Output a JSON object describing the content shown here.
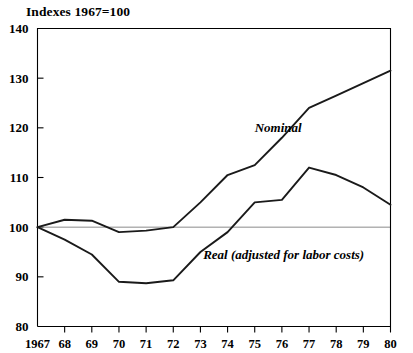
{
  "chart_data": {
    "type": "line",
    "title": "Indexes 1967=100",
    "xlabel": "",
    "ylabel": "",
    "ylim": [
      80,
      140
    ],
    "yticks": [
      80,
      90,
      100,
      110,
      120,
      130,
      140
    ],
    "ytick_labels": [
      "80",
      "90",
      "100",
      "110",
      "120",
      "130",
      "140"
    ],
    "grid": false,
    "baseline_value": 100,
    "legend_position": "inline-annotation",
    "categories": [
      "1967",
      "68",
      "69",
      "70",
      "71",
      "72",
      "73",
      "74",
      "75",
      "76",
      "77",
      "78",
      "79",
      "80"
    ],
    "x": [
      1967,
      1968,
      1969,
      1970,
      1971,
      1972,
      1973,
      1974,
      1975,
      1976,
      1977,
      1978,
      1979,
      1980
    ],
    "series": [
      {
        "name": "Nominal",
        "label": "Nominal",
        "color": "#1a1a1a",
        "values": [
          100,
          101.5,
          101.3,
          99,
          99.3,
          100,
          105,
          110.5,
          112.5,
          118,
          124,
          126.5,
          129,
          131.5
        ]
      },
      {
        "name": "Real",
        "label": "Real (adjusted for labor costs)",
        "color": "#1a1a1a",
        "values": [
          100,
          97.5,
          94.5,
          89,
          88.7,
          89.3,
          95,
          99,
          105,
          105.5,
          112,
          110.5,
          108,
          104.5
        ]
      }
    ],
    "annotations": [
      {
        "text": "Nominal",
        "x": 1975.0,
        "y": 119.2
      },
      {
        "text": "Real (adjusted for labor costs)",
        "x": 1973.1,
        "y": 93.6
      }
    ]
  }
}
